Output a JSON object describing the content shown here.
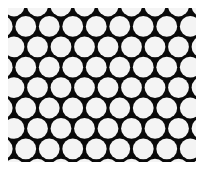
{
  "diagram": {
    "type": "hexagonal-circle-packing",
    "colors": {
      "background": "#ffffff",
      "fill": "#0a0a0a",
      "circle": "#f4f4f4"
    },
    "frame": {
      "x": 8,
      "y": 8,
      "width": 188,
      "height": 154
    },
    "grid": {
      "pitch_x": 23.5,
      "pitch_y": 20.4,
      "radius": 10.4,
      "rows": 9,
      "cols": 10,
      "origin_x": 14,
      "origin_y": 6
    }
  }
}
